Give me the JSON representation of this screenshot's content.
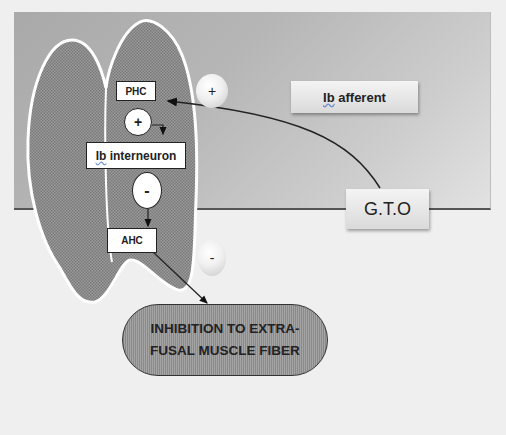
{
  "diagram": {
    "nodes": {
      "phc": "PHC",
      "ib_interneuron_prefix": "Ib",
      "ib_interneuron_suffix": " interneuron",
      "ahc": "AHC",
      "ib_afferent_prefix": "Ib",
      "ib_afferent_suffix": " afferent",
      "gto": "G.T.O",
      "inhibition_line1": "INHIBITION TO EXTRA-",
      "inhibition_line2": "FUSAL MUSCLE FIBER"
    },
    "signs": {
      "excitatory_bubble": "+",
      "inhibitory_bubble": "-",
      "interneuron_excite": "+",
      "interneuron_inhibit": "-"
    },
    "colors": {
      "background_dark": "#a9a9a9",
      "background_light": "#e2e2e2",
      "spinal_cord_fill": "#8f8f8f",
      "outline": "#ffffff",
      "text": "#222222"
    }
  }
}
